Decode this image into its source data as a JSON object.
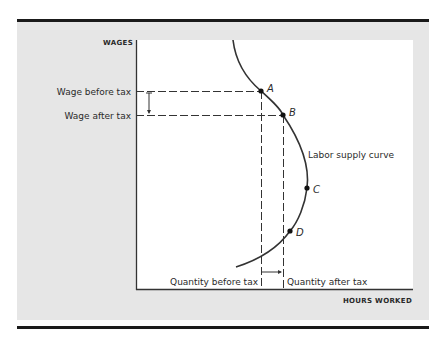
{
  "diagram": {
    "y_axis_label": "WAGES",
    "x_axis_label": "HOURS WORKED",
    "wage_levels": {
      "before": "Wage before tax",
      "after": "Wage after tax"
    },
    "quantities": {
      "before": "Quantity before tax",
      "after": "Quantity after tax"
    },
    "curve_label": "Labor supply curve",
    "points": [
      {
        "label": "A",
        "x": 261,
        "y": 91
      },
      {
        "label": "B",
        "x": 283,
        "y": 115
      },
      {
        "label": "C",
        "x": 307,
        "y": 188
      },
      {
        "label": "D",
        "x": 290,
        "y": 231
      }
    ],
    "colors": {
      "panel": "#e6e6e6",
      "plot": "#ffffff",
      "ink": "#2a2a2a",
      "rule": "#1a1a1a"
    }
  }
}
